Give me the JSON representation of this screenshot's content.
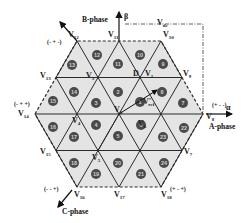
{
  "diagram": {
    "title": "",
    "axes": {
      "alpha_label": "α",
      "beta_label": "β",
      "a_phase": "A-phase",
      "b_phase": "B-phase",
      "c_phase": "C-phase",
      "vdc_label": "V",
      "vdc_sub": "dc"
    },
    "vertices": {
      "V0": {
        "label": "V",
        "sub": "0"
      },
      "V1": {
        "label": "V",
        "sub": "1"
      },
      "V3": {
        "label": "V",
        "sub": "3"
      },
      "V4": {
        "label": "V",
        "sub": "4"
      },
      "V5": {
        "label": "V",
        "sub": "5"
      },
      "V6": {
        "label": "V",
        "sub": "6"
      },
      "V7": {
        "label": "V",
        "sub": "7"
      },
      "V8": {
        "label": "V",
        "sub": "8"
      },
      "V9": {
        "label": "V",
        "sub": "9"
      },
      "V10": {
        "label": "V",
        "sub": "10"
      },
      "V11": {
        "label": "V",
        "sub": "11"
      },
      "V12": {
        "label": "V",
        "sub": "12"
      },
      "V13": {
        "label": "V",
        "sub": "13"
      },
      "V14": {
        "label": "V",
        "sub": "14"
      },
      "V15": {
        "label": "V",
        "sub": "15"
      },
      "V16": {
        "label": "V",
        "sub": "16"
      },
      "V17": {
        "label": "V",
        "sub": "17"
      },
      "V18": {
        "label": "V",
        "sub": "18"
      }
    },
    "switching_states": {
      "V8": "(+ - -)",
      "V12": "(- + -)",
      "V14": "(- + +)",
      "V16": "(- - +)",
      "V18": "(+ - +)"
    },
    "point_D": "D",
    "vref": {
      "label": "V",
      "sub": "ref",
      "sup": "*"
    },
    "regions": [
      "1",
      "2",
      "3",
      "4",
      "5",
      "6",
      "7",
      "8",
      "9",
      "10",
      "11",
      "12",
      "13",
      "14",
      "15",
      "16",
      "17",
      "18",
      "19",
      "20",
      "21",
      "22",
      "23",
      "24"
    ],
    "colors": {
      "fill": "#e4e4e4",
      "line": "#2a2a2a",
      "circle": "#4a4a4a"
    }
  }
}
